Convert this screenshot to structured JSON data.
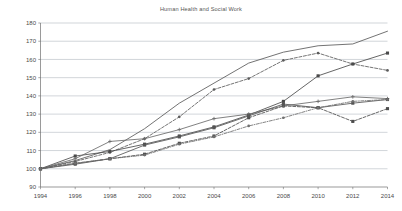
{
  "chart_data": {
    "type": "line",
    "title": "Human Health and Social Work",
    "xlabel": "",
    "ylabel": "",
    "x": [
      1994,
      1996,
      1998,
      2000,
      2002,
      2004,
      2006,
      2008,
      2010,
      2012,
      2014
    ],
    "xlim": [
      1994,
      2014
    ],
    "ylim": [
      90,
      180
    ],
    "ytick_labels": [
      "90",
      "100",
      "110",
      "120",
      "130",
      "140",
      "150",
      "160",
      "170",
      "180"
    ],
    "ytick_values": [
      90,
      100,
      110,
      120,
      130,
      140,
      150,
      160,
      170,
      180
    ],
    "xtick_labels": [
      "1994",
      "1996",
      "1998",
      "2000",
      "2002",
      "2004",
      "2006",
      "2008",
      "2010",
      "2012",
      "2014"
    ],
    "grid": true,
    "legend": "none",
    "index_base": 100,
    "series": [
      {
        "name": "series-1",
        "style": "solid",
        "marker": "none",
        "color": "#5a5a5a",
        "values": [
          100.0,
          104.5,
          110.5,
          122.0,
          136.0,
          147.0,
          158.0,
          164.0,
          167.5,
          168.5,
          175.5
        ]
      },
      {
        "name": "series-2",
        "style": "dashed",
        "marker": "square",
        "color": "#4d4d4d",
        "values": [
          100.0,
          103.0,
          105.5,
          108.0,
          114.0,
          118.0,
          128.0,
          134.5,
          133.5,
          126.0,
          133.0
        ]
      },
      {
        "name": "series-3",
        "style": "dashed",
        "marker": "circle",
        "color": "#5c5c5c",
        "values": [
          100.0,
          104.0,
          109.0,
          116.5,
          128.5,
          143.5,
          149.5,
          159.5,
          163.5,
          157.5,
          154.0
        ]
      },
      {
        "name": "series-4",
        "style": "solid",
        "marker": "square",
        "color": "#4a4a4a",
        "values": [
          100.0,
          107.0,
          109.5,
          113.5,
          118.0,
          123.0,
          129.5,
          137.0,
          151.0,
          157.5,
          163.5
        ]
      },
      {
        "name": "series-5",
        "style": "solid",
        "marker": "plus",
        "color": "#6a6a6a",
        "values": [
          100.0,
          105.5,
          115.0,
          116.5,
          121.5,
          127.5,
          130.0,
          134.5,
          137.0,
          139.5,
          138.5
        ]
      },
      {
        "name": "series-6",
        "style": "solid",
        "marker": "square",
        "color": "#555555",
        "values": [
          100.0,
          102.5,
          105.5,
          113.0,
          117.5,
          122.5,
          129.0,
          135.5,
          133.5,
          136.0,
          138.0
        ]
      },
      {
        "name": "series-7",
        "style": "dashdot",
        "marker": "circle",
        "color": "#6f6f6f",
        "values": [
          100.0,
          103.0,
          105.5,
          107.5,
          113.5,
          117.5,
          123.5,
          128.0,
          133.5,
          137.0,
          138.0
        ]
      }
    ]
  },
  "axis": {
    "y_top_label": "180",
    "y_bottom_label": "90"
  }
}
